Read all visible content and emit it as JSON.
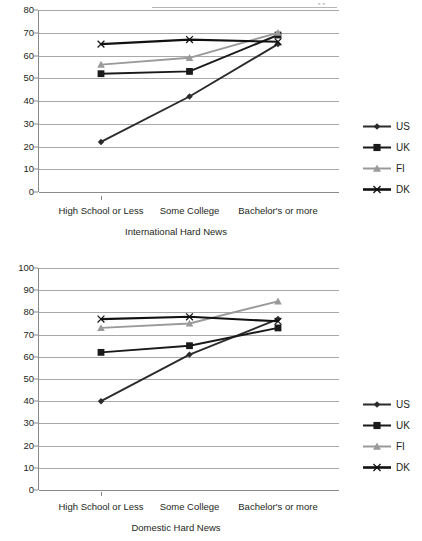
{
  "colors": {
    "us": "#2b2b2b",
    "uk": "#1a1a1a",
    "fi": "#9a9a9a",
    "dk": "#111111",
    "grid": "#a8a8a8",
    "axis": "#8a8a8a",
    "text": "#231f20"
  },
  "charts": [
    {
      "caption": "International Hard News",
      "chart_data": {
        "type": "line",
        "title": "International Hard News",
        "xlabel": "",
        "ylabel": "",
        "categories": [
          "High School or Less",
          "Some College",
          "Bachelor's or more"
        ],
        "ylim": [
          0,
          80
        ],
        "yticks": [
          0,
          10,
          20,
          30,
          40,
          50,
          60,
          70,
          80
        ],
        "ytick_labels": [
          "0",
          "10",
          "20",
          "30",
          "40",
          "50",
          "60",
          "70",
          "80"
        ],
        "grid": true,
        "legend": "right",
        "series": [
          {
            "name": "US",
            "marker": "diamond",
            "color": "#2b2b2b",
            "values": [
              22,
              42,
              65
            ]
          },
          {
            "name": "UK",
            "marker": "square",
            "color": "#1a1a1a",
            "values": [
              52,
              53,
              69
            ]
          },
          {
            "name": "FI",
            "marker": "triangle",
            "color": "#9a9a9a",
            "values": [
              56,
              59,
              70
            ]
          },
          {
            "name": "DK",
            "marker": "cross",
            "color": "#111111",
            "values": [
              65,
              67,
              66
            ]
          }
        ]
      },
      "legend_items": [
        {
          "label": "US",
          "marker": "diamond",
          "color": "#2b2b2b"
        },
        {
          "label": "UK",
          "marker": "square",
          "color": "#1a1a1a"
        },
        {
          "label": "FI",
          "marker": "triangle",
          "color": "#9a9a9a"
        },
        {
          "label": "DK",
          "marker": "cross",
          "color": "#111111"
        }
      ]
    },
    {
      "caption": "Domestic Hard News",
      "chart_data": {
        "type": "line",
        "title": "Domestic Hard News",
        "xlabel": "",
        "ylabel": "",
        "categories": [
          "High School or Less",
          "Some College",
          "Bachelor's or more"
        ],
        "ylim": [
          0,
          100
        ],
        "yticks": [
          0,
          10,
          20,
          30,
          40,
          50,
          60,
          70,
          80,
          90,
          100
        ],
        "ytick_labels": [
          "0",
          "10",
          "20",
          "30",
          "40",
          "50",
          "60",
          "70",
          "80",
          "90",
          "100"
        ],
        "grid": true,
        "legend": "right",
        "series": [
          {
            "name": "US",
            "marker": "diamond",
            "color": "#2b2b2b",
            "values": [
              40,
              61,
              77
            ]
          },
          {
            "name": "UK",
            "marker": "square",
            "color": "#1a1a1a",
            "values": [
              62,
              65,
              73
            ]
          },
          {
            "name": "FI",
            "marker": "triangle",
            "color": "#9a9a9a",
            "values": [
              73,
              75,
              85
            ]
          },
          {
            "name": "DK",
            "marker": "cross",
            "color": "#111111",
            "values": [
              77,
              78,
              76
            ]
          }
        ]
      },
      "legend_items": [
        {
          "label": "US",
          "marker": "diamond",
          "color": "#2b2b2b"
        },
        {
          "label": "UK",
          "marker": "square",
          "color": "#1a1a1a"
        },
        {
          "label": "FI",
          "marker": "triangle",
          "color": "#9a9a9a"
        },
        {
          "label": "DK",
          "marker": "cross",
          "color": "#111111"
        }
      ]
    }
  ]
}
